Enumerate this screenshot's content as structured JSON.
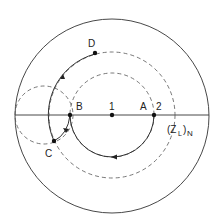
{
  "diagram": {
    "type": "smith-chart-impedance-matching",
    "labels": {
      "D": "D",
      "B": "B",
      "one": "1",
      "A": "A",
      "two": "2",
      "C": "C",
      "zl_main": "(Z",
      "zl_sub": "L",
      "zl_close": ")",
      "zl_n": "N"
    },
    "colors": {
      "line": "#333333",
      "dashed": "#555555",
      "point": "#111111"
    }
  }
}
